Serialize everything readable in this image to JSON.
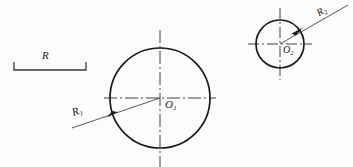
{
  "figure": {
    "type": "engineering-drawing",
    "background_color": "#fcfcfc",
    "line_color": "#1a1a1a",
    "width": 353,
    "height": 167
  },
  "scale_bar": {
    "label": "R",
    "x_start": 14,
    "x_end": 86,
    "baseline_y": 70,
    "tick_top_y": 62
  },
  "circles": [
    {
      "name": "large-circle",
      "center_label": "O",
      "center_subscript": "1",
      "cx": 160,
      "cy": 98,
      "r": 50,
      "radius_label": "R",
      "radius_subscript": "1",
      "centerline_h": {
        "x1": 104,
        "x2": 216,
        "y": 98
      },
      "centerline_v": {
        "y1": 30,
        "y2": 167,
        "x": 160
      },
      "leader": {
        "x1": 72,
        "y1": 128,
        "x2": 160,
        "y2": 98
      },
      "arrow_x": 112,
      "arrow_y": 114
    },
    {
      "name": "small-circle",
      "center_label": "O",
      "center_subscript": "2",
      "cx": 280,
      "cy": 44,
      "r": 24,
      "radius_label": "R",
      "radius_subscript": "2",
      "centerline_h": {
        "x1": 248,
        "x2": 312,
        "y": 44
      },
      "centerline_v": {
        "y1": 8,
        "y2": 80,
        "x": 280
      },
      "leader": {
        "x1": 280,
        "y1": 44,
        "x2": 348,
        "y2": 5
      },
      "arrow_x": 297,
      "arrow_y": 30
    }
  ],
  "labels": {
    "scale_R": "R",
    "center_O1": "O",
    "center_O1_sub": "1",
    "radius_R1": "R",
    "radius_R1_sub": "1",
    "center_O2": "O",
    "center_O2_sub": "2",
    "radius_R2": "R",
    "radius_R2_sub": "2"
  }
}
